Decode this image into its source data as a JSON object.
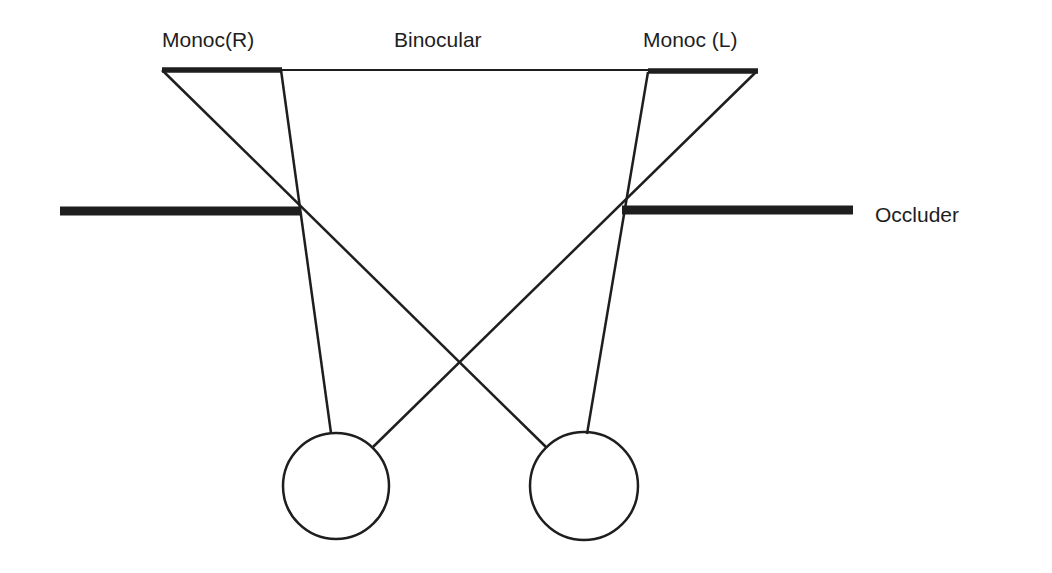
{
  "labels": {
    "monoc_right": "Monoc(R)",
    "binocular": "Binocular",
    "monoc_left": "Monoc (L)",
    "occluder": "Occluder"
  },
  "colors": {
    "ink": "#1e1e1e",
    "background": "#ffffff"
  }
}
